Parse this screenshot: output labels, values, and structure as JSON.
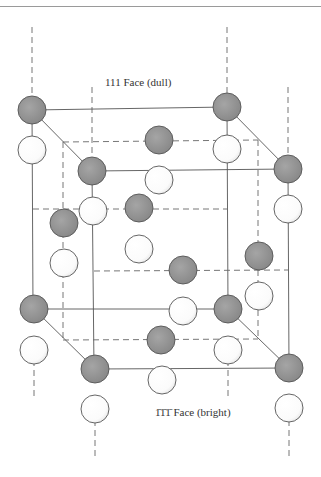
{
  "figure": {
    "type": "crystal-unit-cell",
    "labels": {
      "top": "111 Face (dull)",
      "bottom_prefix": "1̄1̄1̄",
      "bottom_suffix": " Face (bright)"
    },
    "colors": {
      "dark_atom": "#8f8f8f",
      "light_atom": "#ffffff",
      "outline": "#555555"
    },
    "atoms": {
      "dark": [
        [
          32,
          110
        ],
        [
          227,
          107
        ],
        [
          159,
          140
        ],
        [
          92,
          171
        ],
        [
          288,
          169
        ],
        [
          139,
          208
        ],
        [
          64,
          223
        ],
        [
          259,
          256
        ],
        [
          183,
          270
        ],
        [
          34,
          309
        ],
        [
          228,
          309
        ],
        [
          161,
          340
        ],
        [
          95,
          369
        ],
        [
          289,
          368
        ]
      ],
      "light": [
        [
          32,
          150
        ],
        [
          227,
          149
        ],
        [
          159,
          180
        ],
        [
          93,
          211
        ],
        [
          288,
          209
        ],
        [
          139,
          249
        ],
        [
          64,
          263
        ],
        [
          259,
          296
        ],
        [
          183,
          311
        ],
        [
          34,
          350
        ],
        [
          228,
          350
        ],
        [
          162,
          380
        ],
        [
          95,
          409
        ],
        [
          289,
          408
        ]
      ]
    }
  }
}
